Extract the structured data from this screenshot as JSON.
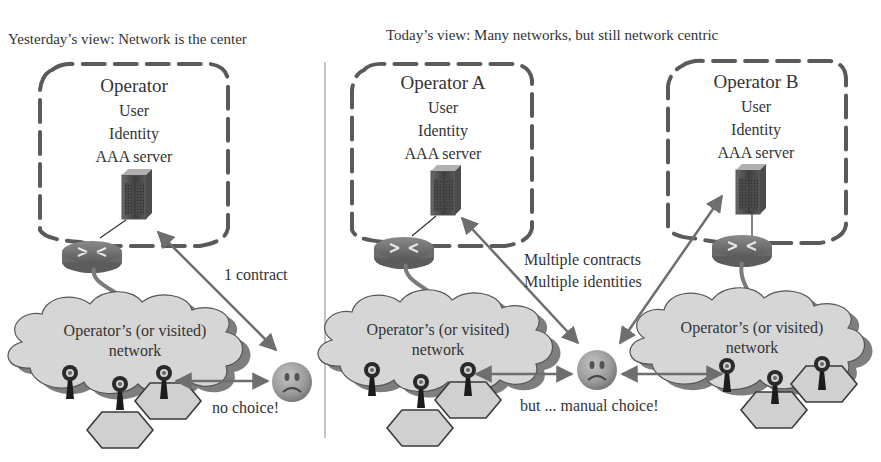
{
  "left_panel": {
    "title": "Yesterday’s view: Network is the center",
    "operator": {
      "name": "Operator",
      "lines": [
        "User",
        "Identity",
        "AAA server"
      ]
    },
    "cloud": {
      "line1": "Operator’s (or visited)",
      "line2": "network"
    },
    "contract_label": "1 contract",
    "choice_label": "no choice!"
  },
  "right_panel": {
    "title": "Today’s view: Many networks, but still network centric",
    "operator_a": {
      "name": "Operator A",
      "lines": [
        "User",
        "Identity",
        "AAA server"
      ]
    },
    "operator_b": {
      "name": "Operator B",
      "lines": [
        "User",
        "Identity",
        "AAA server"
      ]
    },
    "cloud_a": {
      "line1": "Operator’s (or visited)",
      "line2": "network"
    },
    "cloud_b": {
      "line1": "Operator’s (or visited)",
      "line2": "network"
    },
    "contracts_label": [
      "Multiple contracts",
      "Multiple identities"
    ],
    "choice_label": "but ... manual choice!"
  },
  "icons": {
    "server": "aaa-server-icon",
    "router": "router-icon",
    "access_point": "access-point-icon",
    "cell": "hexagon-cell-icon",
    "user": "sad-face-icon"
  },
  "colors": {
    "dash_border": "#5a5a5a",
    "cloud_fill": "#d6d6d6",
    "arrow": "#6e6e6e",
    "divider": "#8a8a8a",
    "text": "#333333"
  }
}
